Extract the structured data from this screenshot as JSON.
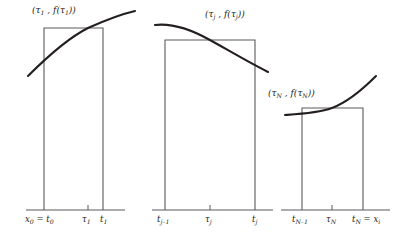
{
  "figure": {
    "type": "math-diagram",
    "background": "#ffffff",
    "stroke_color": "#231f20",
    "curve_color": "#231f20"
  },
  "panels": [
    {
      "id": "panel-1",
      "point_label": "(τ₁ , f(τ₁))",
      "point_label_plain": "(tau_1, f(tau_1))",
      "rect": {
        "x0": 44,
        "x1": 103,
        "top": 28,
        "base": 210
      },
      "axis": {
        "x0": 26,
        "x1": 125,
        "y": 210
      },
      "curve": "concave-increasing",
      "ticks": [
        {
          "x": 44,
          "label_left": "x",
          "label_left_sub": "0",
          "eq": " = ",
          "label_right": "t",
          "label_right_sub": "0",
          "tick": false
        },
        {
          "x": 88,
          "label_left": "τ",
          "label_left_sub": "1",
          "eq": "",
          "label_right": "",
          "label_right_sub": "",
          "tick": true
        },
        {
          "x": 103,
          "label_left": "t",
          "label_left_sub": "1",
          "eq": "",
          "label_right": "",
          "label_right_sub": "",
          "tick": false
        }
      ]
    },
    {
      "id": "panel-2",
      "point_label": "(τⱼ , f(τⱼ))",
      "point_label_plain": "(tau_j, f(tau_j))",
      "rect": {
        "x0": 165,
        "x1": 255,
        "top": 40,
        "base": 210
      },
      "axis": {
        "x0": 152,
        "x1": 273,
        "y": 210
      },
      "curve": "concave-decreasing",
      "ticks": [
        {
          "x": 165,
          "label_left": "t",
          "label_left_sub": "j–1",
          "eq": "",
          "label_right": "",
          "label_right_sub": "",
          "tick": false
        },
        {
          "x": 210,
          "label_left": "τ",
          "label_left_sub": "j",
          "eq": "",
          "label_right": "",
          "label_right_sub": "",
          "tick": true
        },
        {
          "x": 255,
          "label_left": "t",
          "label_left_sub": "j",
          "eq": "",
          "label_right": "",
          "label_right_sub": "",
          "tick": false
        }
      ]
    },
    {
      "id": "panel-3",
      "point_label": "(τₙ , f(τₙ))",
      "point_label_plain": "(tau_N, f(tau_N))",
      "rect": {
        "x0": 302,
        "x1": 363,
        "top": 108,
        "base": 210
      },
      "axis": {
        "x0": 281,
        "x1": 390,
        "y": 210
      },
      "curve": "convex-increasing",
      "ticks": [
        {
          "x": 302,
          "label_left": "t",
          "label_left_sub": "N–1",
          "eq": "",
          "label_right": "",
          "label_right_sub": "",
          "tick": false
        },
        {
          "x": 332,
          "label_left": "τ",
          "label_left_sub": "N",
          "eq": "",
          "label_right": "",
          "label_right_sub": "",
          "tick": true
        },
        {
          "x": 363,
          "label_left": "t",
          "label_left_sub": "N",
          "eq": " = ",
          "label_right": "x",
          "label_right_sub": "i",
          "tick": false
        }
      ]
    }
  ],
  "labels": {
    "p1_tau": "τ",
    "p1_t": "t",
    "p1_x": "x",
    "f_sym": "f",
    "paren_open": "(",
    "paren_close": ")",
    "comma": ",",
    "equals": "="
  },
  "tick_text": {
    "p1_x0t0_x": "x",
    "p1_x0t0_x_sub": "0",
    "p1_x0t0_eq": " = ",
    "p1_x0t0_t": "t",
    "p1_x0t0_t_sub": "0",
    "p1_tau1": "τ",
    "p1_tau1_sub": "1",
    "p1_t1": "t",
    "p1_t1_sub": "1",
    "p2_tjm1": "t",
    "p2_tjm1_sub": "j–1",
    "p2_tauj": "τ",
    "p2_tauj_sub": "j",
    "p2_tj": "t",
    "p2_tj_sub": "j",
    "p3_tNm1": "t",
    "p3_tNm1_sub": "N–1",
    "p3_tauN": "τ",
    "p3_tauN_sub": "N",
    "p3_tN": "t",
    "p3_tN_sub": "N",
    "p3_eq": " = ",
    "p3_xi": "x",
    "p3_xi_sub": "i"
  },
  "point_labels": {
    "p1": {
      "open": "(",
      "tau": "τ",
      "tau_sub": "1",
      "comma": " , ",
      "f": "f",
      "po": "(",
      "tau2": "τ",
      "tau2_sub": "1",
      "pc": ")",
      "close": ")"
    },
    "p2": {
      "open": "(",
      "tau": "τ",
      "tau_sub": "j",
      "comma": " , ",
      "f": "f",
      "po": "(",
      "tau2": "τ",
      "tau2_sub": "j",
      "pc": ")",
      "close": ")"
    },
    "p3": {
      "open": "(",
      "tau": "τ",
      "tau_sub": "N",
      "comma": " , ",
      "f": "f",
      "po": "(",
      "tau2": "τ",
      "tau2_sub": "N",
      "pc": ")",
      "close": ")"
    }
  }
}
